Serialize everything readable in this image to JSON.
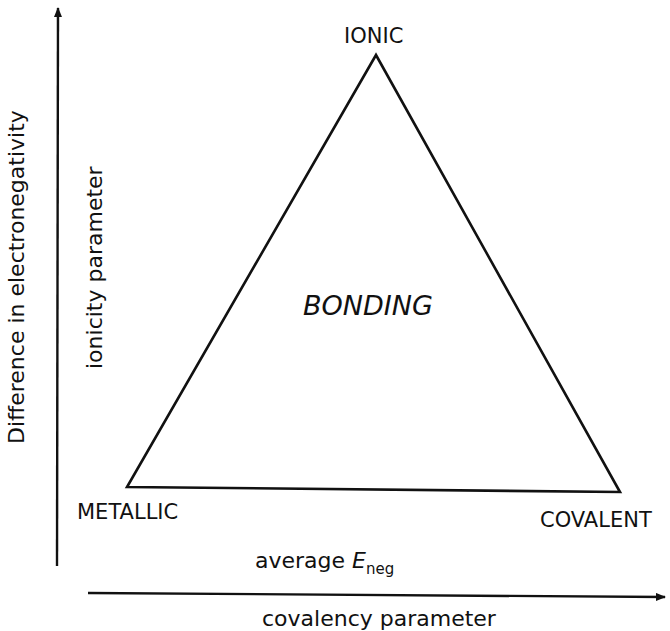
{
  "diagram": {
    "center_label": "BONDING",
    "vertices": {
      "top": "IONIC",
      "bottom_left": "METALLIC",
      "bottom_right": "COVALENT"
    },
    "y_axis": {
      "outer_label": "Difference in electronegativity",
      "inner_label": "ionicity parameter"
    },
    "x_axis": {
      "top_label_main": "average ",
      "top_label_symbol": "E",
      "top_label_subscript": "neg",
      "bottom_label": "covalency parameter"
    },
    "colors": {
      "line": "#111111",
      "background": "#ffffff"
    }
  }
}
